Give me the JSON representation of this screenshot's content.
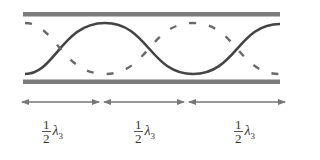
{
  "diagram": {
    "colors": {
      "wall": "#7a7a7a",
      "wave_solid": "#444444",
      "wave_dashed": "#6a6a6a",
      "arrow": "#777777"
    },
    "segments": [
      {
        "num": "1",
        "den": "2",
        "symbol": "λ",
        "subscript": "3"
      },
      {
        "num": "1",
        "den": "2",
        "symbol": "λ",
        "subscript": "3"
      },
      {
        "num": "1",
        "den": "2",
        "symbol": "λ",
        "subscript": "3"
      }
    ]
  }
}
